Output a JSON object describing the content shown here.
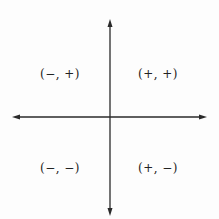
{
  "diagram": {
    "type": "coordinate-plane-quadrants",
    "axis_color": "#2a2a2a",
    "quadrants": [
      {
        "id": "II",
        "label": "(−, +)",
        "x": 60,
        "y": 74
      },
      {
        "id": "I",
        "label": "(+, +)",
        "x": 158,
        "y": 74
      },
      {
        "id": "III",
        "label": "(−, −)",
        "x": 60,
        "y": 168
      },
      {
        "id": "IV",
        "label": "(+, −)",
        "x": 158,
        "y": 168
      }
    ]
  }
}
